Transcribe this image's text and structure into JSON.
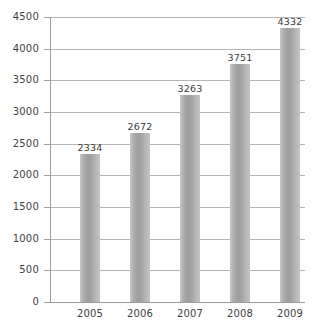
{
  "chart_data": {
    "type": "bar",
    "title": "",
    "subtitle": "",
    "xlabel": "",
    "ylabel": "",
    "categories": [
      "2005",
      "2006",
      "2007",
      "2008",
      "2009"
    ],
    "values": [
      2334,
      2672,
      3263,
      3751,
      4332
    ],
    "data_labels": [
      "2334",
      "2672",
      "3263",
      "3751",
      "4332"
    ],
    "ylim": [
      0,
      4500
    ],
    "ytick_step": 500,
    "ytick_labels": [
      "4500",
      "4000",
      "3500",
      "3000",
      "2500",
      "2000",
      "1500",
      "1000",
      "500",
      "0"
    ],
    "ytick_values": [
      4500,
      4000,
      3500,
      3000,
      2500,
      2000,
      1500,
      1000,
      500,
      0
    ],
    "grid": true,
    "grid_orientation": "horizontal",
    "legend": false,
    "legend_position": "none",
    "series": [
      {
        "name": "",
        "values": [
          2334,
          2672,
          3263,
          3751,
          4332
        ]
      }
    ],
    "colors": {
      "bar_fill": "#a8a8a8",
      "bar_highlight": "#c9c9c9",
      "bar_shadow": "#9e9e9e",
      "gridline": "#b5b5b5",
      "axis": "#9d9d9d",
      "text": "#3f3f3f",
      "background": "#ffffff"
    }
  }
}
